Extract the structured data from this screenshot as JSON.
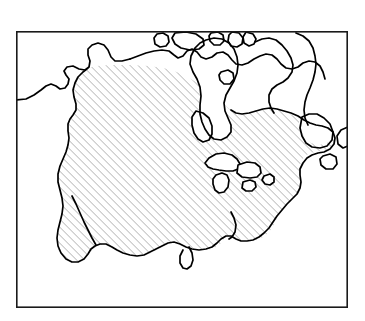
{
  "figure": {
    "kind": "distribution-range-map",
    "region": "North America",
    "title": "",
    "caption": "",
    "style": {
      "background_color": "#ffffff",
      "coastline_color": "#000000",
      "frame_color": "#1a1a1a",
      "hatch_color": "#8d8d8d",
      "top_strip_color": "#d8d8d8",
      "coastline_stroke_width": 1.7,
      "frame_stroke_width": 1.6,
      "hatch_stroke_width": 0.55,
      "hatch_spacing_px": 4,
      "hatch_angle_deg": 45,
      "hatch_direction": "ascending-left-to-right"
    },
    "frame": {
      "x": 16,
      "y": 31,
      "width": 332,
      "height": 277
    },
    "legend_entries": [
      {
        "label": "",
        "pattern": "diagonal-hatch"
      }
    ],
    "landmass_labels": [],
    "annotations": []
  },
  "geometry": {
    "mainland_coastline": "M16,100 L23,100 L30,95 L36,90 L42,86 L47,83 L53,83 L57,86 L61,88 L66,87 L69,83 L71,79 L69,75 L66,72 L67,68 L71,66 L76,66 L80,69 L84,70 L88,68 L90,63 L89,58 L87,54 L89,50 L94,47 L99,46 L104,48 L107,52 L109,57 L112,60 L118,61 L124,60 L130,58 L136,55 L142,52 L148,50 L154,49 L160,48 L166,48 L170,50 L173,54 L176,57 L180,56 L183,52 L186,49 L190,48 L194,50 L197,54 L200,57 L204,58 L209,56 L213,53 L217,51 L222,51 L226,53 L229,57 L231,61 L234,64 L239,65 L244,64 L249,62 L253,59 L257,56 L262,54 L267,53 L272,54 L276,57 L279,61 L282,65 L286,68 L291,69 L296,68 L300,65 L304,62 L309,60 L314,60 L318,63 L321,67 L323,72 L325,78 L326,85 L326,92 L324,99 L321,105 L317,110 L313,114 L308,117 L303,119 L298,121 L294,124 L291,128 L289,133 L290,138 L293,141 L297,142 L301,141 L304,138 L306,134 L309,132 L313,133 L316,136 L317,141 L316,146 L313,150 L309,152 L304,153 L299,153 L294,152 L290,150 L286,149 L282,150 L279,153 L277,157 L276,162 L277,167 L279,172 L281,177 L282,183 L281,189 L279,194 L276,199 L272,203 L268,207 L264,211 L261,216 L259,221 L258,227 L256,232 L253,236 L249,239 L245,241 L241,242 L237,241 L234,239 L232,236 L231,232 L232,228 L234,225 L236,222 L237,218 L235,215 L231,214 L227,215 L224,218 L222,222 L221,227 L219,232 L216,236 L212,239 L207,241 L202,242 L197,242 L192,241 L188,239 L184,236 L180,234 L176,233 L172,234 L168,236 L164,239 L160,242 L156,245 L152,248 L147,250 L142,251 L137,251 L132,250 L127,248 L122,246 L118,243 L114,240 L110,238 L106,237 L102,238 L98,240 L95,243 L92,247 L90,252 L88,257 L85,261 L81,264 L76,265 L71,265 L66,263 L62,260 L59,256 L57,251 L56,246 L56,240 L57,234 L59,228 L61,222 L62,216 L62,210 L61,204 L59,198 L57,192 L56,186 L56,180 L57,174 L59,168 L61,162 L63,157 L65,152 L66,147 L66,142 L65,137 L64,132 L64,127 L66,123 L69,120 L72,118 L74,115 L74,111 L72,108 L69,106 L66,104 L64,101 L64,97 L66,94 L69,92 L71,89 L71,85 L69,82",
    "shapes": [
      {
        "name": "alaska-west-coast",
        "type": "coastline-segment"
      },
      {
        "name": "hudson-bay",
        "type": "inland-sea"
      },
      {
        "name": "hudson-bay-island",
        "type": "island"
      },
      {
        "name": "greenland-coast",
        "type": "coastline-segment"
      },
      {
        "name": "baffin-island",
        "type": "island"
      },
      {
        "name": "arctic-islands",
        "type": "island-group"
      },
      {
        "name": "cuba",
        "type": "island"
      },
      {
        "name": "hispaniola",
        "type": "island"
      },
      {
        "name": "jamaica",
        "type": "island"
      },
      {
        "name": "puerto-rico",
        "type": "island"
      },
      {
        "name": "bermuda-area-island",
        "type": "island"
      },
      {
        "name": "newfoundland",
        "type": "island"
      },
      {
        "name": "baja-california",
        "type": "peninsula"
      },
      {
        "name": "florida",
        "type": "peninsula"
      },
      {
        "name": "yucatan",
        "type": "peninsula"
      }
    ]
  }
}
